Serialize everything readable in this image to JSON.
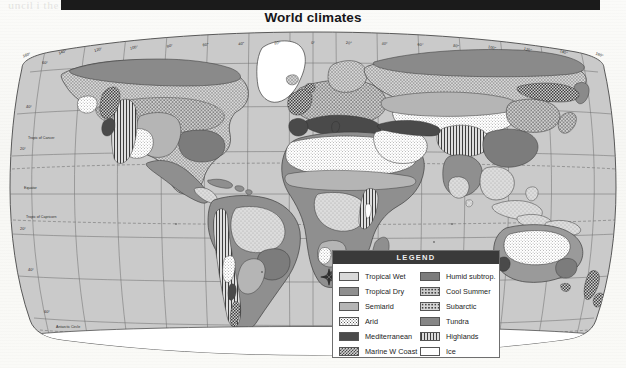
{
  "document": {
    "title": "World climates",
    "redaction_bar": true,
    "ghost_text_top": "uncil i   the  . . . . . . .  s  a  r  e  v  u  o  c  n  a  v",
    "ghost_text_bottom": ""
  },
  "map": {
    "projection": "Robinson",
    "ocean_color": "#cfcfcf",
    "graticule_color": "#6b6b6b",
    "outline_color": "#3c3c3c",
    "longitude_labels": [
      "160°",
      "140°",
      "120°",
      "100°",
      "80°",
      "60°",
      "40°",
      "20°",
      "0°",
      "20°",
      "40°",
      "60°",
      "80°",
      "100°",
      "120°",
      "140°",
      "160°"
    ],
    "latitude_labels_left": [
      {
        "text": "60°",
        "kind": "parallel"
      },
      {
        "text": "40°",
        "kind": "parallel"
      },
      {
        "text": "Tropic of Cancer",
        "kind": "special"
      },
      {
        "text": "20°",
        "kind": "parallel"
      },
      {
        "text": "Equator",
        "kind": "special"
      },
      {
        "text": "20°",
        "kind": "parallel"
      },
      {
        "text": "Tropic of Capricorn",
        "kind": "special"
      },
      {
        "text": "40°",
        "kind": "parallel"
      },
      {
        "text": "60°",
        "kind": "parallel"
      },
      {
        "text": "Antarctic Circle",
        "kind": "special"
      }
    ]
  },
  "legend": {
    "header": "LEGEND",
    "left_column": [
      {
        "label": "Tropical Wet",
        "fill": "f-tropical-wet",
        "pattern": "p-sparse",
        "color": "#d9d9d9"
      },
      {
        "label": "Tropical Dry",
        "fill": "f-tropical-dry",
        "pattern": "",
        "color": "#8f8f8f"
      },
      {
        "label": "Semiarid",
        "fill": "f-semiarid",
        "pattern": "",
        "color": "#b5b5b5"
      },
      {
        "label": "Arid",
        "fill": "f-arid",
        "pattern": "p-dots-fine",
        "color": "#ffffff"
      },
      {
        "label": "Mediterranean",
        "fill": "f-mediterranean",
        "pattern": "",
        "color": "#4a4a4a"
      },
      {
        "label": "Marine W Coast",
        "fill": "f-marine-w-coast",
        "pattern": "p-check",
        "color": "#cfcfcf"
      }
    ],
    "right_column": [
      {
        "label": "Humid subtrop.",
        "fill": "f-humid-subtrop",
        "pattern": "",
        "color": "#7c7c7c"
      },
      {
        "label": "Cool Summer",
        "fill": "f-cool-summer",
        "pattern": "p-dots-coarse",
        "color": "#cccccc"
      },
      {
        "label": "Subarctic",
        "fill": "f-subarctic",
        "pattern": "p-dots-coarse",
        "color": "#d6d6d6"
      },
      {
        "label": "Tundra",
        "fill": "f-tundra",
        "pattern": "",
        "color": "#868686"
      },
      {
        "label": "Highlands",
        "fill": "f-highlands",
        "pattern": "p-vlines",
        "color": "#dcdcdc"
      },
      {
        "label": "Ice",
        "fill": "f-ice",
        "pattern": "",
        "color": "#ffffff"
      }
    ]
  },
  "chart_data": {
    "type": "map",
    "title": "World climates",
    "projection": "Robinson",
    "classes": [
      "Tropical Wet",
      "Tropical Dry",
      "Semiarid",
      "Arid",
      "Mediterranean",
      "Marine W Coast",
      "Humid subtrop.",
      "Cool Summer",
      "Subarctic",
      "Tundra",
      "Highlands",
      "Ice"
    ],
    "graticule_interval_deg": 20,
    "lon_range": [
      -180,
      180
    ],
    "lat_range": [
      -90,
      90
    ]
  }
}
